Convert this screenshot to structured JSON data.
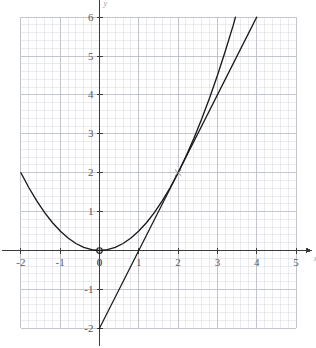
{
  "chart_data": {
    "type": "line",
    "title": "",
    "subtitle": "",
    "xlabel": "x",
    "ylabel": "y",
    "xlim": [
      -2.3,
      5.4
    ],
    "ylim": [
      -2.45,
      6.3
    ],
    "xticks": [
      -2,
      -1,
      0,
      1,
      2,
      3,
      4,
      5
    ],
    "yticks": [
      -2,
      -1,
      0,
      1,
      2,
      3,
      4,
      5,
      6
    ],
    "xtick_labels": [
      "-2",
      "-1",
      "0",
      "1",
      "2",
      "3",
      "4",
      "5"
    ],
    "ytick_labels": [
      "-2",
      "-1",
      "0",
      "1",
      "2",
      "3",
      "4",
      "5",
      "6"
    ],
    "grid": true,
    "grid_major_step": 1,
    "grid_minor_step": 0.2,
    "legend": "none",
    "series": [
      {
        "name": "parabola",
        "equation": "y = x^2 / 2",
        "type": "curve",
        "x": [
          -2,
          -1.8,
          -1.6,
          -1.4,
          -1.2,
          -1,
          -0.8,
          -0.6,
          -0.4,
          -0.2,
          0,
          0.2,
          0.4,
          0.6,
          0.8,
          1,
          1.2,
          1.4,
          1.6,
          1.8,
          2,
          2.2,
          2.4,
          2.6,
          2.8,
          3,
          3.2,
          3.4,
          3.46
        ],
        "y": [
          2,
          1.62,
          1.28,
          0.98,
          0.72,
          0.5,
          0.32,
          0.18,
          0.08,
          0.02,
          0,
          0.02,
          0.08,
          0.18,
          0.32,
          0.5,
          0.72,
          0.98,
          1.28,
          1.62,
          2,
          2.42,
          2.88,
          3.38,
          3.92,
          4.5,
          5.12,
          5.78,
          6
        ]
      },
      {
        "name": "tangent-line",
        "equation": "y = 2x - 2",
        "type": "line",
        "x": [
          0,
          1,
          2,
          3,
          4
        ],
        "y": [
          -2,
          0,
          2,
          4,
          6
        ]
      }
    ],
    "points": [
      {
        "name": "origin-point",
        "x": 0,
        "y": 0,
        "marker": "open-circle"
      },
      {
        "name": "tangency-point",
        "x": 2,
        "y": 2,
        "marker": "cross"
      }
    ],
    "colors": {
      "curve": "#1a1a1a",
      "axis": "#3c3c3c",
      "grid_major": "#b9bcc6",
      "grid_minor": "#dcdee6",
      "tick_text": "#5a5a5a",
      "axis_label": "#9a9a9a",
      "background": "#ffffff"
    }
  },
  "axis_names": {
    "x": "x",
    "y": "y"
  }
}
